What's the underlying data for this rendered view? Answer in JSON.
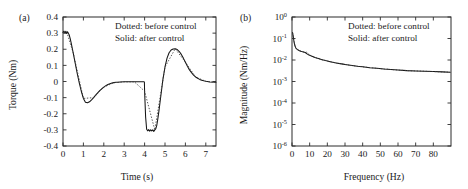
{
  "figure": {
    "panels": [
      {
        "id": "a",
        "label": "(a)",
        "legend": {
          "line1": "Dotted: before control",
          "line2": "Solid: after control"
        },
        "chart_data": {
          "type": "line",
          "title": "",
          "xlabel": "Time (s)",
          "ylabel": "Torque (Nm)",
          "xlim": [
            0,
            7.5
          ],
          "ylim": [
            -0.4,
            0.4
          ],
          "xticks": [
            0,
            1,
            2,
            3,
            4,
            5,
            6,
            7
          ],
          "xticklabels": [
            "0",
            "1",
            "2",
            "3",
            "4",
            "5",
            "6",
            "7"
          ],
          "yticks": [
            -0.4,
            -0.3,
            -0.2,
            -0.1,
            0,
            0.1,
            0.2,
            0.3,
            0.4
          ],
          "yticklabels": [
            "-0.4",
            "-0.3",
            "-0.2",
            "-0.1",
            "0",
            "0.1",
            "0.2",
            "0.3",
            "0.4"
          ],
          "grid": false,
          "legend_position": "upper-right",
          "series": [
            {
              "name": "after control",
              "style": "solid",
              "x": [
                0.0,
                0.05,
                0.1,
                0.14,
                0.18,
                0.22,
                0.26,
                0.3,
                0.35,
                0.4,
                0.5,
                0.6,
                0.7,
                0.8,
                0.9,
                1.0,
                1.1,
                1.2,
                1.3,
                1.4,
                1.5,
                1.6,
                1.7,
                1.8,
                1.9,
                2.0,
                2.1,
                2.2,
                2.3,
                2.4,
                2.5,
                2.6,
                2.7,
                2.8,
                3.0,
                3.2,
                3.5,
                3.8,
                3.96,
                3.99,
                4.0,
                4.05,
                4.1,
                4.15,
                4.2,
                4.25,
                4.3,
                4.35,
                4.4,
                4.45,
                4.5,
                4.55,
                4.6,
                4.65,
                4.7,
                4.8,
                4.9,
                5.0,
                5.1,
                5.2,
                5.3,
                5.4,
                5.5,
                5.6,
                5.7,
                5.8,
                5.9,
                6.0,
                6.1,
                6.2,
                6.3,
                6.4,
                6.5,
                6.6,
                6.7,
                6.8,
                6.9,
                7.0,
                7.2,
                7.5
              ],
              "y": [
                0.305,
                0.312,
                0.3,
                0.312,
                0.298,
                0.308,
                0.3,
                0.29,
                0.268,
                0.24,
                0.178,
                0.112,
                0.048,
                -0.01,
                -0.062,
                -0.105,
                -0.128,
                -0.132,
                -0.126,
                -0.114,
                -0.1,
                -0.085,
                -0.07,
                -0.057,
                -0.045,
                -0.035,
                -0.026,
                -0.019,
                -0.014,
                -0.01,
                -0.007,
                -0.005,
                -0.004,
                -0.003,
                -0.002,
                -0.002,
                -0.002,
                -0.002,
                -0.002,
                -0.003,
                -0.06,
                -0.22,
                -0.296,
                -0.306,
                -0.298,
                -0.308,
                -0.299,
                -0.307,
                -0.3,
                -0.309,
                -0.3,
                -0.292,
                -0.27,
                -0.23,
                -0.185,
                -0.085,
                0.015,
                0.09,
                0.145,
                0.178,
                0.195,
                0.202,
                0.203,
                0.198,
                0.186,
                0.168,
                0.145,
                0.12,
                0.095,
                0.072,
                0.055,
                0.04,
                0.028,
                0.02,
                0.013,
                0.008,
                0.004,
                0.001,
                -0.003,
                -0.005
              ]
            },
            {
              "name": "before control",
              "style": "dotted",
              "x": [
                0.0,
                0.2,
                0.5,
                1.0,
                1.5,
                2.0,
                2.5,
                3.0,
                3.5,
                4.0,
                4.5,
                5.0,
                5.5,
                6.0,
                6.5,
                7.0,
                7.5
              ],
              "y": [
                0.305,
                0.3,
                0.178,
                -0.105,
                -0.1,
                -0.035,
                -0.007,
                -0.002,
                -0.002,
                -0.06,
                -0.3,
                0.09,
                0.203,
                0.12,
                0.028,
                0.001,
                -0.005
              ]
            }
          ]
        }
      },
      {
        "id": "b",
        "label": "(b)",
        "legend": {
          "line1": "Dotted: before control",
          "line2": "Solid: after control"
        },
        "chart_data": {
          "type": "line",
          "title": "",
          "xlabel": "Frequency (Hz)",
          "ylabel": "Magnitude (Nm/Hz)",
          "xlim": [
            0,
            90
          ],
          "ylim": [
            1e-06,
            1
          ],
          "yscale": "log",
          "xticks": [
            0,
            10,
            20,
            30,
            40,
            50,
            60,
            70,
            80
          ],
          "xticklabels": [
            "0",
            "10",
            "20",
            "30",
            "40",
            "50",
            "60",
            "70",
            "80"
          ],
          "yticks": [
            1e-06,
            1e-05,
            0.0001,
            0.001,
            0.01,
            0.1,
            1
          ],
          "yticklabels": [
            "10-6",
            "10-5",
            "10-4",
            "10-3",
            "10-2",
            "10-1",
            "100"
          ],
          "ymantissa": "10",
          "yexponents": [
            "-6",
            "-5",
            "-4",
            "-3",
            "-2",
            "-1",
            "0"
          ],
          "grid": false,
          "legend_position": "upper-right",
          "series": [
            {
              "name": "after control",
              "style": "solid",
              "x": [
                0.3,
                0.6,
                1.0,
                1.4,
                1.8,
                2.2,
                2.6,
                3.0,
                3.5,
                4.0,
                4.5,
                5.0,
                5.5,
                6.0,
                6.5,
                7.0,
                7.5,
                8.0,
                8.5,
                9.0,
                10.0,
                11.0,
                12.0,
                13.0,
                14.0,
                15.0,
                17.0,
                19.0,
                21.0,
                23.0,
                25.0,
                28.0,
                31.0,
                34.0,
                37.0,
                40.0,
                44.0,
                48.0,
                52.0,
                56.0,
                60.0,
                65.0,
                70.0,
                75.0,
                80.0,
                85.0,
                89.5
              ],
              "y": [
                0.19,
                0.145,
                0.083,
                0.055,
                0.042,
                0.036,
                0.033,
                0.031,
                0.029,
                0.0275,
                0.0265,
                0.0255,
                0.0248,
                0.0242,
                0.0236,
                0.023,
                0.0224,
                0.0206,
                0.0192,
                0.0182,
                0.0166,
                0.0152,
                0.0141,
                0.0131,
                0.0123,
                0.0116,
                0.0104,
                0.0094,
                0.0086,
                0.0079,
                0.0073,
                0.0066,
                0.006,
                0.0055,
                0.0051,
                0.0048,
                0.0044,
                0.0041,
                0.0038,
                0.0036,
                0.0034,
                0.0032,
                0.0031,
                0.003,
                0.0029,
                0.0028,
                0.0027
              ]
            },
            {
              "name": "before control",
              "style": "dotted",
              "x": [
                0.3,
                1.0,
                2.0,
                3.0,
                4.5,
                6.0,
                7.5,
                8.2,
                9.0,
                11.0,
                14.0,
                18.0,
                23.0,
                28.0,
                34.0,
                40.0,
                48.0,
                56.0,
                65.0,
                75.0,
                85.0,
                89.5
              ],
              "y": [
                0.19,
                0.083,
                0.038,
                0.031,
                0.0265,
                0.0242,
                0.0224,
                0.0235,
                0.0195,
                0.0152,
                0.0123,
                0.0098,
                0.0079,
                0.0066,
                0.0055,
                0.0048,
                0.0041,
                0.0036,
                0.0032,
                0.003,
                0.0028,
                0.0027
              ]
            }
          ]
        }
      }
    ]
  }
}
